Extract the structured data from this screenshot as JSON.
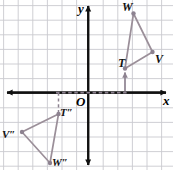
{
  "figure": {
    "type": "coordinate-plane-geometry",
    "width": 173,
    "height": 170,
    "background_color": "#ffffff",
    "grid": {
      "color": "#c9c9cf",
      "spacing_px": 14.6,
      "visible": true
    },
    "axes": {
      "color": "#111111",
      "origin_px": {
        "x": 88.0,
        "y": 93.0
      },
      "x_axis_label": "x",
      "y_axis_label": "y",
      "origin_label": "O",
      "arrowheads": [
        "left",
        "right",
        "up",
        "down"
      ]
    },
    "shapes": {
      "stroke_color": "#9b8f99",
      "vertex_dot_color": "#8d8290",
      "preimage": {
        "name": "triangle-TWV",
        "vertices": [
          {
            "label": "T",
            "px": {
              "x": 125.0,
              "y": 68.5
            },
            "grid": {
              "x": 2.5,
              "y": 1.7
            }
          },
          {
            "label": "W",
            "px": {
              "x": 133.5,
              "y": 13.5
            },
            "grid": {
              "x": 3.1,
              "y": 5.4
            }
          },
          {
            "label": "V",
            "px": {
              "x": 152.5,
              "y": 52.0
            },
            "grid": {
              "x": 4.4,
              "y": 2.8
            }
          }
        ]
      },
      "image": {
        "name": "triangle-T2V2W2",
        "vertices": [
          {
            "label": "T″",
            "px": {
              "x": 58.5,
              "y": 114.0
            },
            "grid": {
              "x": -2.0,
              "y": -1.4
            }
          },
          {
            "label": "V″",
            "px": {
              "x": 22.0,
              "y": 132.0
            },
            "grid": {
              "x": -4.5,
              "y": -2.7
            }
          },
          {
            "label": "W″",
            "px": {
              "x": 50.0,
              "y": 163.0
            },
            "grid": {
              "x": -2.6,
              "y": -4.8
            }
          }
        ]
      }
    },
    "annotations": {
      "translation_arrow": {
        "name": "arrow-to-T",
        "color": "#8d8290",
        "from_px": {
          "x": 125.0,
          "y": 91.5
        },
        "to_px": {
          "x": 125.0,
          "y": 70.5
        }
      },
      "dashed_x_axis_segment": {
        "name": "dashed-axis-segment",
        "color": "#8d8290",
        "from_px": {
          "x": 56.0,
          "y": 92.5
        },
        "to_px": {
          "x": 127.0,
          "y": 92.5
        }
      },
      "dashed_drop_line": {
        "name": "dashed-drop-line-to-T2",
        "color": "#8d8290",
        "from_px": {
          "x": 58.5,
          "y": 92.5
        },
        "to_px": {
          "x": 58.5,
          "y": 112.0
        }
      }
    },
    "labels": {
      "T": "T",
      "W": "W",
      "V": "V",
      "T_double_prime": "T″",
      "V_double_prime": "V″",
      "W_double_prime": "W″",
      "origin": "O",
      "x": "x",
      "y": "y"
    }
  }
}
